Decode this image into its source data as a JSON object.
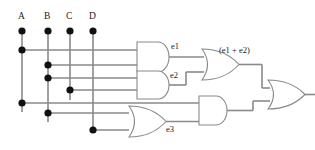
{
  "diagram": {
    "type": "logic-circuit",
    "colors": {
      "background": "#ffffff",
      "wire": "#8a8a8a",
      "gate_outline": "#8a8a8a",
      "dot": "#111111",
      "text": "#1a1a1a"
    },
    "inputs": [
      {
        "id": "A",
        "label": "A",
        "x": 22
      },
      {
        "id": "B",
        "label": "B",
        "x": 48
      },
      {
        "id": "C",
        "label": "C",
        "x": 70
      },
      {
        "id": "D",
        "label": "D",
        "x": 93
      }
    ],
    "signals": [
      {
        "id": "e1",
        "label": "e1"
      },
      {
        "id": "e2",
        "label": "e2"
      },
      {
        "id": "e3",
        "label": "e3"
      },
      {
        "id": "e1e2",
        "label": "(e1 + e2)"
      }
    ],
    "gates": [
      {
        "id": "and-e1",
        "kind": "AND",
        "output_label": "e1"
      },
      {
        "id": "and-e2",
        "kind": "AND",
        "output_label": "e2"
      },
      {
        "id": "or-e1e2",
        "kind": "OR",
        "output_label": "(e1 + e2)"
      },
      {
        "id": "or-e3",
        "kind": "OR",
        "output_label": "e3"
      },
      {
        "id": "and-lower",
        "kind": "AND",
        "output_label": ""
      },
      {
        "id": "or-final",
        "kind": "OR",
        "output_label": ""
      }
    ]
  }
}
